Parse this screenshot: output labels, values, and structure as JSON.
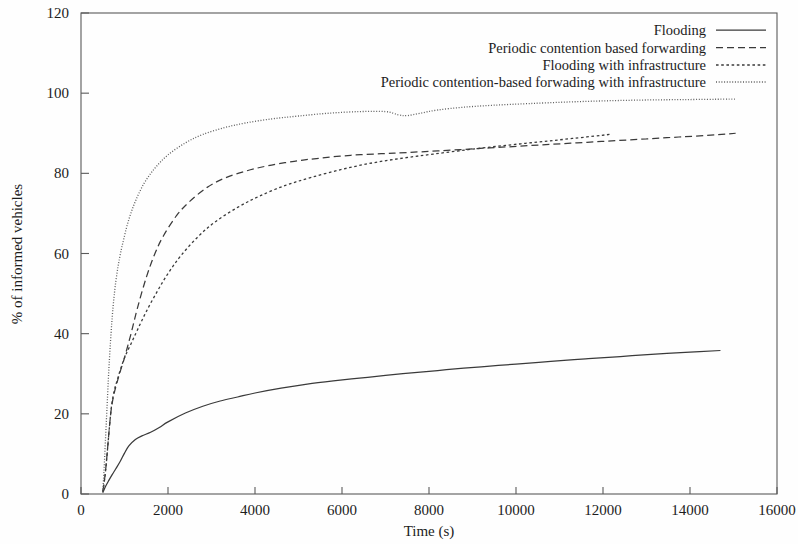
{
  "chart_data": {
    "type": "line",
    "title": "",
    "xlabel": "Time (s)",
    "ylabel": "% of informed vehicles",
    "xlim": [
      0,
      16000
    ],
    "ylim": [
      0,
      120
    ],
    "xticks": [
      0,
      2000,
      4000,
      6000,
      8000,
      10000,
      12000,
      14000,
      16000
    ],
    "yticks": [
      0,
      20,
      40,
      60,
      80,
      100,
      120
    ],
    "xtick_labels": [
      "0",
      "2000",
      "4000",
      "6000",
      "8000",
      "10000",
      "12000",
      "14000",
      "16000"
    ],
    "ytick_labels": [
      "0",
      "20",
      "40",
      "60",
      "80",
      "100",
      "120"
    ],
    "grid": false,
    "legend_position": "top-right",
    "series": [
      {
        "name": "Flooding",
        "style": "solid",
        "color": "#3a3a3a",
        "x": [
          500,
          560,
          640,
          720,
          800,
          900,
          1000,
          1100,
          1250,
          1400,
          1600,
          1800,
          2000,
          2400,
          2800,
          3200,
          3600,
          4000,
          4600,
          5200,
          5800,
          6400,
          7000,
          7600,
          8200,
          8800,
          9400,
          10000,
          10800,
          11600,
          12400,
          13200,
          14000,
          14700
        ],
        "y": [
          0.3,
          1.8,
          3.4,
          4.9,
          6.3,
          8.1,
          10.2,
          12.0,
          13.6,
          14.5,
          15.4,
          16.6,
          18.0,
          20.2,
          21.9,
          23.2,
          24.2,
          25.2,
          26.4,
          27.4,
          28.2,
          28.9,
          29.6,
          30.2,
          30.8,
          31.4,
          31.9,
          32.4,
          33.1,
          33.7,
          34.3,
          34.9,
          35.4,
          35.8
        ]
      },
      {
        "name": "Periodic contention based forwarding",
        "style": "dashed",
        "color": "#3a3a3a",
        "x": [
          500,
          540,
          580,
          620,
          660,
          700,
          760,
          820,
          900,
          1000,
          1150,
          1300,
          1500,
          1700,
          1900,
          2200,
          2500,
          2900,
          3300,
          3800,
          4300,
          4900,
          5500,
          6200,
          6900,
          7500,
          8200,
          9000,
          9800,
          10600,
          11400,
          12200,
          13000,
          13800,
          14600,
          15050
        ],
        "y": [
          0.5,
          3.5,
          7.5,
          12.5,
          17.5,
          21.5,
          25.0,
          27.5,
          30.5,
          34.0,
          40.0,
          46.5,
          54.0,
          60.0,
          64.5,
          69.5,
          73.0,
          76.5,
          78.8,
          80.6,
          81.9,
          83.0,
          83.8,
          84.5,
          84.9,
          85.2,
          85.6,
          86.1,
          86.6,
          87.1,
          87.6,
          88.1,
          88.6,
          89.1,
          89.6,
          90.0
        ]
      },
      {
        "name": "Flooding with infrastructure",
        "style": "dotted",
        "color": "#3a3a3a",
        "x": [
          500,
          540,
          580,
          620,
          660,
          700,
          760,
          830,
          920,
          1020,
          1150,
          1300,
          1500,
          1750,
          2000,
          2300,
          2700,
          3100,
          3600,
          4100,
          4700,
          5300,
          6000,
          6700,
          7400,
          8100,
          8900,
          9700,
          10500,
          11300,
          12150
        ],
        "y": [
          0.5,
          3.5,
          7.5,
          12.5,
          17.5,
          21.8,
          25.6,
          28.3,
          31.5,
          34.5,
          37.5,
          41.0,
          45.5,
          50.5,
          55.0,
          59.5,
          64.3,
          68.0,
          71.5,
          74.3,
          77.0,
          79.0,
          81.0,
          82.6,
          83.8,
          84.8,
          85.9,
          86.9,
          87.8,
          88.7,
          89.7
        ]
      },
      {
        "name": "Periodic contention-based forwading with infrastructure",
        "style": "finedotted",
        "color": "#5e5e5e",
        "x": [
          500,
          530,
          560,
          600,
          640,
          690,
          740,
          800,
          880,
          980,
          1100,
          1250,
          1450,
          1700,
          2000,
          2400,
          2800,
          3300,
          3800,
          4400,
          5000,
          5700,
          6400,
          7000,
          7300,
          7500,
          7800,
          8200,
          8800,
          9500,
          10300,
          11200,
          12100,
          13000,
          13900,
          14800,
          15050
        ],
        "y": [
          0.5,
          6.0,
          13.0,
          22.0,
          31.0,
          40.0,
          47.0,
          53.0,
          58.5,
          63.5,
          68.5,
          73.0,
          77.5,
          81.3,
          84.6,
          87.6,
          89.7,
          91.4,
          92.6,
          93.6,
          94.3,
          95.0,
          95.4,
          95.4,
          94.6,
          94.4,
          95.0,
          95.8,
          96.5,
          97.0,
          97.4,
          97.8,
          98.1,
          98.3,
          98.4,
          98.5,
          98.5
        ]
      }
    ]
  },
  "legend": {
    "entries": [
      {
        "label": "Flooding",
        "style": "solid"
      },
      {
        "label": "Periodic contention based forwarding",
        "style": "dashed"
      },
      {
        "label": "Flooding with infrastructure",
        "style": "dotted"
      },
      {
        "label": "Periodic contention-based forwading with infrastructure",
        "style": "finedotted"
      }
    ]
  },
  "axes": {
    "x_title": "Time (s)",
    "y_title": "% of informed vehicles"
  },
  "colors": {
    "axis": "#5a5a5a",
    "text": "#1c1c1c",
    "series_dark": "#3a3a3a",
    "series_light": "#5e5e5e",
    "background": "#fefefe"
  }
}
